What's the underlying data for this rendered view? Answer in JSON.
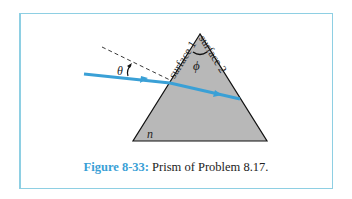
{
  "figure": {
    "caption_label": "Figure 8-33:",
    "caption_text": "Prism of Problem 8.17.",
    "labels": {
      "surface1": "surface 1",
      "surface2": "surface 2",
      "apex_angle": "ϕ",
      "incidence_angle": "θ",
      "refractive_index": "n"
    },
    "colors": {
      "prism_fill": "#b8b8b8",
      "ray": "#3aa0d6",
      "frame": "#8ecfe3",
      "caption_label": "#3aa0d6"
    }
  }
}
